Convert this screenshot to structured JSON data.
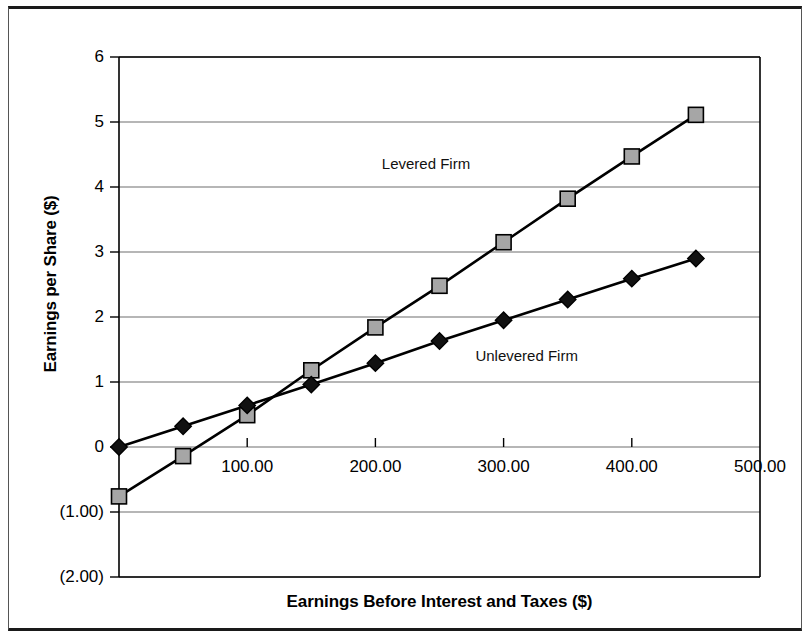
{
  "chart_data": {
    "type": "line",
    "title": "",
    "xlabel": "Earnings Before Interest and Taxes ($)",
    "ylabel": "Earnings per Share ($)",
    "xlim": [
      0,
      500
    ],
    "ylim": [
      -2,
      6
    ],
    "grid": "horizontal",
    "legend_position": "inline-annotations",
    "x": [
      0,
      50,
      100,
      150,
      200,
      250,
      300,
      350,
      400,
      450
    ],
    "xticks": [
      {
        "value": 100,
        "label": "100.00"
      },
      {
        "value": 200,
        "label": "200.00"
      },
      {
        "value": 300,
        "label": "300.00"
      },
      {
        "value": 400,
        "label": "400.00"
      },
      {
        "value": 500,
        "label": "500.00"
      }
    ],
    "yticks": [
      {
        "value": 6,
        "label": "6"
      },
      {
        "value": 5,
        "label": "5"
      },
      {
        "value": 4,
        "label": "4"
      },
      {
        "value": 3,
        "label": "3"
      },
      {
        "value": 2,
        "label": "2"
      },
      {
        "value": 1,
        "label": "1"
      },
      {
        "value": 0,
        "label": "0"
      },
      {
        "value": -1,
        "label": "(1.00)"
      },
      {
        "value": -2,
        "label": "(2.00)"
      }
    ],
    "series": [
      {
        "name": "Levered Firm",
        "marker": "square",
        "marker_fill": "#a6a6a6",
        "marker_stroke": "#000000",
        "line_color": "#000000",
        "annotation": "Levered Firm",
        "annotation_x": 205,
        "annotation_y": 4.5,
        "values": [
          -0.76,
          -0.14,
          0.49,
          1.18,
          1.84,
          2.48,
          3.15,
          3.82,
          4.47,
          5.11
        ]
      },
      {
        "name": "Unlevered Firm",
        "marker": "diamond",
        "marker_fill": "#111111",
        "marker_stroke": "#000000",
        "line_color": "#000000",
        "annotation": "Unlevered Firm",
        "annotation_x": 278,
        "annotation_y": 1.54,
        "values": [
          0.0,
          0.32,
          0.64,
          0.96,
          1.29,
          1.63,
          1.95,
          2.27,
          2.59,
          2.9
        ]
      }
    ]
  },
  "colors": {
    "grid": "#6e6e6e",
    "axis": "#000000",
    "plot_background": "#ffffff",
    "frame": "#1a1a1a",
    "levered_marker": "#a6a6a6",
    "unlevered_marker": "#111111"
  }
}
